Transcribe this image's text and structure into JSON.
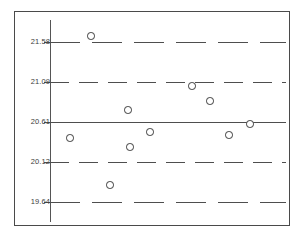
{
  "chart_data": {
    "type": "scatter",
    "title": "",
    "subtitle": "",
    "xlabel": "",
    "ylabel": "",
    "grid": true,
    "legend": "none",
    "xlim": [
      0,
      11
    ],
    "ylim": [
      19.4,
      21.85
    ],
    "ytick_labels": [
      "21.58",
      "21.09",
      "20.61",
      "20.12",
      "19.64"
    ],
    "ytick_values": [
      21.58,
      21.09,
      20.61,
      20.12,
      19.64
    ],
    "control_limits": [
      {
        "name": "UCL",
        "label": "21.58",
        "value": 21.58,
        "style": "dashed-long",
        "px_y": 42
      },
      {
        "name": "plus1s",
        "label": "21.09",
        "value": 21.09,
        "style": "dashed-medium",
        "px_y": 82
      },
      {
        "name": "CL",
        "label": "20.61",
        "value": 20.61,
        "style": "solid",
        "px_y": 122
      },
      {
        "name": "minus1s",
        "label": "20.12",
        "value": 20.12,
        "style": "dashed-medium",
        "px_y": 162
      },
      {
        "name": "LCL",
        "label": "19.64",
        "value": 19.64,
        "style": "dashed-long",
        "px_y": 202
      }
    ],
    "series": [
      {
        "name": "individual-value",
        "marker": "open-circle",
        "x": [
          1,
          2,
          3,
          4,
          5,
          6,
          7,
          8,
          9,
          10
        ],
        "values": [
          20.46,
          21.66,
          19.85,
          20.31,
          20.79,
          20.52,
          21.03,
          20.87,
          20.53,
          20.6
        ],
        "points_px": [
          {
            "x": 70,
            "y": 138
          },
          {
            "x": 91,
            "y": 36
          },
          {
            "x": 110,
            "y": 185
          },
          {
            "x": 130,
            "y": 147
          },
          {
            "x": 128,
            "y": 110
          },
          {
            "x": 150,
            "y": 132
          },
          {
            "x": 192,
            "y": 86
          },
          {
            "x": 210,
            "y": 101
          },
          {
            "x": 229,
            "y": 135
          },
          {
            "x": 250,
            "y": 124
          }
        ]
      }
    ]
  }
}
